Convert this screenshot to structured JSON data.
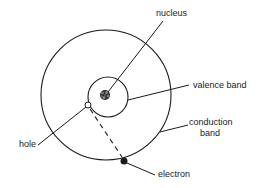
{
  "diagram": {
    "type": "atom-energy-band-diagram",
    "colors": {
      "line": "#1a1a1a",
      "background": "#ffffff",
      "hole_fill": "#ffffff",
      "electron_fill": "#1a1a1a"
    },
    "labels": {
      "nucleus": "nucleus",
      "valence_band": "valence band",
      "conduction_band_line1": "conduction",
      "conduction_band_line2": "band",
      "hole": "hole",
      "electron": "electron"
    },
    "elements": {
      "outer_circle": {
        "name": "conduction band",
        "cx": 106,
        "cy": 95,
        "r": 65
      },
      "inner_circle": {
        "name": "valence band",
        "cx": 108,
        "cy": 97,
        "r": 20
      },
      "nucleus": {
        "cx": 105,
        "cy": 95,
        "r": 5
      },
      "hole": {
        "cx": 88,
        "cy": 105,
        "r": 3
      },
      "electron": {
        "cx": 124,
        "cy": 161,
        "r": 3.5
      },
      "transition": {
        "style": "dashed",
        "from": "hole",
        "to": "electron"
      }
    }
  }
}
